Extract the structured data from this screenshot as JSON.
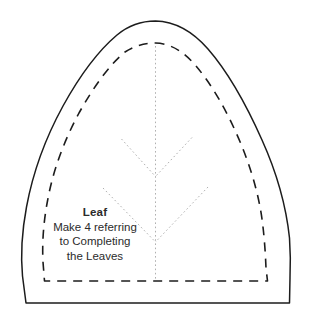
{
  "document": {
    "type": "sewing-pattern-template",
    "title": "Leaf",
    "background_color": "#ffffff"
  },
  "pattern": {
    "cut_line": {
      "style": "solid",
      "color": "#1c1c1c",
      "width_px": 1.5,
      "name": "outer-cut-line"
    },
    "stitch_line": {
      "style": "dashed",
      "color": "#1c1c1c",
      "width_px": 1.6,
      "dash": "9 7",
      "name": "inner-stitch-line"
    },
    "vein_lines": {
      "style": "dotted",
      "color": "#b0b0b0",
      "width_px": 1,
      "dash": "1.6 2.6",
      "name": "vein-guide-lines"
    }
  },
  "label": {
    "title": "Leaf",
    "line1": "Make 4 referring",
    "line2": "to Completing",
    "line3": "the Leaves",
    "color": "#2b2b2b"
  },
  "geometry": {
    "cut_path": "M 155.5 21 C 177 21.5 194 33 208 49 C 228 72 246 104 262 140 C 276 171 286 205 289.5 238 C 290.5 252 290.5 266 290 278 L 289.5 303 L 26 303 L 22.5 276 C 20.5 254 22 231 26.5 207 C 33 172 46 137 63 106 C 79 77 98 51 117 35 C 129 25 142 21 155.5 21 Z",
    "stitch_path": "M 155.5 43 C 172 43.5 185 53 196 66 C 213 86 228 113 241 144 C 252 171 260 199 263 227 C 264.5 240 265.5 255 266 268 L 267.5 281 L 44.5 281 L 43 262 C 42 243 43.5 222 47.5 201 C 53 170 64.5 140 79 113 C 93 88 109 65 125 52 C 135 45.5 145.5 43 155.5 43 Z",
    "midrib": {
      "x": 155.5,
      "y_top": 46,
      "y_bottom": 281
    },
    "vein_upper_left": {
      "x1": 121.5,
      "y1": 139,
      "x2": 155.5,
      "y2": 176.5
    },
    "vein_upper_right": {
      "x1": 192,
      "y1": 137.5,
      "x2": 155.5,
      "y2": 176.5
    },
    "vein_lower_left": {
      "x1": 103,
      "y1": 188,
      "x2": 155.5,
      "y2": 242
    },
    "vein_lower_right": {
      "x1": 208,
      "y1": 187,
      "x2": 155.5,
      "y2": 242
    }
  }
}
